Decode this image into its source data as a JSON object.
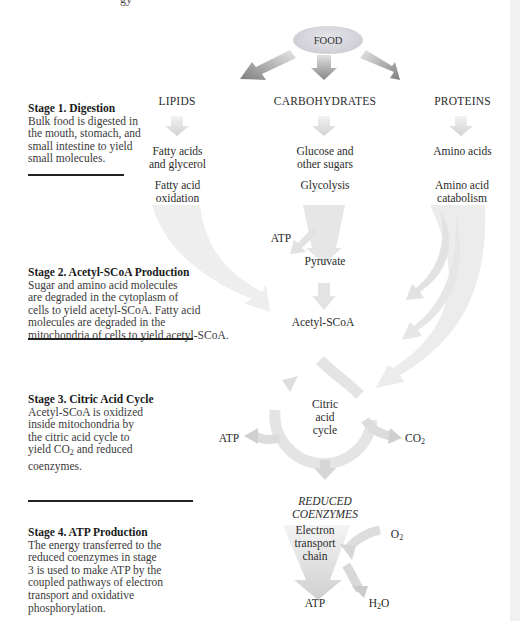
{
  "header_fragment": "gy",
  "diagram": {
    "root": "FOOD",
    "categories": [
      "LIPIDS",
      "CARBOHYDRATES",
      "PROTEINS"
    ],
    "small_molecules": {
      "lipids": [
        "Fatty acids",
        "and glycerol"
      ],
      "carbohydrates": [
        "Glucose and",
        "other sugars"
      ],
      "proteins": [
        "Amino acids"
      ]
    },
    "processes": {
      "lipids": [
        "Fatty acid",
        "oxidation"
      ],
      "carbohydrates": [
        "Glycolysis"
      ],
      "proteins": [
        "Amino acid",
        "catabolism"
      ]
    },
    "glycolysis_atp": "ATP",
    "pyruvate": "Pyruvate",
    "acetyl": "Acetyl-SCoA",
    "cycle": [
      "Citric",
      "acid",
      "cycle"
    ],
    "cycle_atp": "ATP",
    "cycle_co2": "CO",
    "co2_sub": "2",
    "reduced": [
      "REDUCED",
      "COENZYMES"
    ],
    "etc": [
      "Electron",
      "transport",
      "chain"
    ],
    "o2": "O",
    "o2_sub": "2",
    "final_atp": "ATP",
    "h2o_h": "H",
    "h2o_sub": "2",
    "h2o_o": "O"
  },
  "stages": [
    {
      "title": "Stage 1. Digestion",
      "lines": [
        "Bulk food is digested in",
        "the mouth, stomach, and",
        "small intestine to yield",
        "small molecules."
      ]
    },
    {
      "title": "Stage 2. Acetyl-SCoA Production",
      "lines": [
        "Sugar and amino acid molecules",
        "are degraded in the cytoplasm of",
        "cells to yield acetyl-SCoA. Fatty acid",
        "molecules are degraded in the",
        "mitochondria of cells to yield acetyl-SCoA."
      ]
    },
    {
      "title": "Stage 3. Citric Acid Cycle",
      "lines": [
        "Acetyl-SCoA is oxidized",
        "inside mitochondria by",
        "the citric acid cycle to",
        "yield CO",
        "2",
        " and reduced",
        "coenzymes."
      ]
    },
    {
      "title": "Stage 4. ATP Production",
      "lines": [
        "The energy transferred to the",
        "reduced coenzymes in stage",
        "3 is used to make ATP by the",
        "coupled pathways of electron",
        "transport and oxidative",
        "phosphorylation."
      ]
    }
  ],
  "colors": {
    "arrow_dark": "#8c8c8c",
    "arrow_light": "#e3e3e3",
    "rule": "#222222",
    "text": "#2b2b2b"
  }
}
